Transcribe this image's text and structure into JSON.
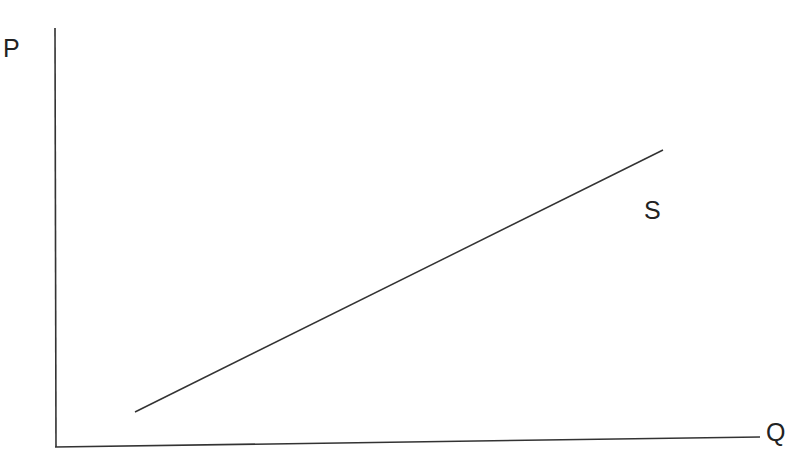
{
  "diagram": {
    "type": "supply-curve",
    "axes": {
      "y_label": "P",
      "x_label": "Q"
    },
    "curves": [
      {
        "name": "supply",
        "label": "S",
        "start": [
          135,
          412
        ],
        "end": [
          663,
          150
        ]
      }
    ],
    "colors": {
      "line": "#333333",
      "text": "#222222",
      "background": "#ffffff"
    }
  }
}
